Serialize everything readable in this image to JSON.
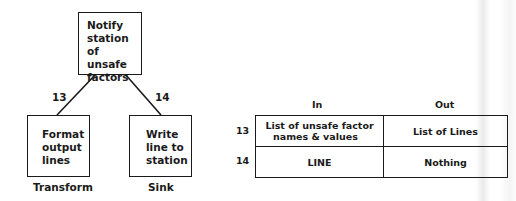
{
  "diagram": {
    "nodes": [
      {
        "id": "top",
        "label_lines": [
          "Notify",
          "station",
          "of unsafe",
          "factors"
        ]
      },
      {
        "id": "left",
        "label_lines": [
          "Format",
          "output",
          "lines"
        ],
        "caption": "Transform"
      },
      {
        "id": "right",
        "label_lines": [
          "Write",
          "line to",
          "station"
        ],
        "caption": "Sink"
      }
    ],
    "edges": [
      {
        "from": "top",
        "to": "left",
        "label": "13"
      },
      {
        "from": "top",
        "to": "right",
        "label": "14"
      }
    ]
  },
  "io_table": {
    "headers": {
      "in": "In",
      "out": "Out"
    },
    "rows": [
      {
        "num": "13",
        "in_lines": [
          "List of unsafe factor",
          "names & values"
        ],
        "out": "List of Lines"
      },
      {
        "num": "14",
        "in_lines": [
          "LINE"
        ],
        "out": "Nothing"
      }
    ]
  },
  "colors": {
    "ink": "#1a1a1a",
    "background": "#ffffff"
  }
}
